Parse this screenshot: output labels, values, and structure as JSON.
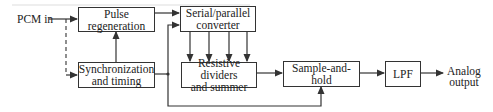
{
  "diagram": {
    "input_label": "PCM in",
    "output_label_line1": "Analog",
    "output_label_line2": "output",
    "blocks": {
      "pulse_regeneration": {
        "line1": "Pulse",
        "line2": "regeneration"
      },
      "serial_parallel": {
        "line1": "Serial/parallel",
        "line2": "converter"
      },
      "sync_timing": {
        "line1": "Synchronization",
        "line2": "and timing"
      },
      "resistive_dividers": {
        "line1": "Resistive dividers",
        "line2": "and summer"
      },
      "sample_hold": {
        "line1": "Sample-and-hold"
      },
      "lpf": {
        "line1": "LPF"
      }
    },
    "parallel_lines_count": 4,
    "line_color": "#333333"
  }
}
